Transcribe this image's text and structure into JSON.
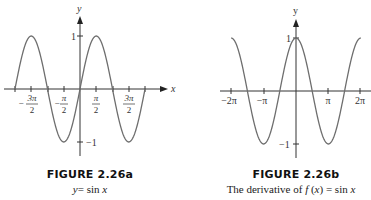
{
  "chart_data": [
    {
      "id": "figure-2-26a",
      "type": "line",
      "title": "FIGURE 2.26a",
      "subtitle": "y = sin x",
      "xlabel": "x",
      "ylabel": "y",
      "function": "sin(x)",
      "x_range": [
        -6.2832,
        6.2832
      ],
      "ylim": [
        -1,
        1
      ],
      "x_ticks": [
        -4.7124,
        -1.5708,
        1.5708,
        4.7124
      ],
      "x_tick_labels": [
        "-3π/2",
        "-π/2",
        "π/2",
        "3π/2"
      ],
      "x_ticks_unlabeled": [
        -6.2832,
        -3.1416,
        3.1416,
        6.2832
      ],
      "y_ticks": [
        1,
        -1
      ],
      "y_tick_labels": [
        "1",
        "-1"
      ],
      "grid": false,
      "legend": null,
      "x": [
        -6.2832,
        -4.7124,
        -3.1416,
        -1.5708,
        0,
        1.5708,
        3.1416,
        4.7124,
        6.2832
      ],
      "y": [
        0,
        1,
        0,
        -1,
        0,
        1,
        0,
        -1,
        0
      ]
    },
    {
      "id": "figure-2-26b",
      "type": "line",
      "title": "FIGURE 2.26b",
      "subtitle": "The derivative of f(x) = sin x",
      "xlabel": "x",
      "ylabel": "y",
      "function": "cos(x)",
      "x_range": [
        -6.2832,
        6.2832
      ],
      "ylim": [
        -1,
        1
      ],
      "x_ticks": [
        -6.2832,
        -3.1416,
        3.1416,
        6.2832
      ],
      "x_tick_labels": [
        "-2π",
        "-π",
        "π",
        "2π"
      ],
      "y_ticks": [
        1,
        -1
      ],
      "y_tick_labels": [
        "1",
        "-1"
      ],
      "grid": false,
      "legend": null,
      "x": [
        -6.2832,
        -4.7124,
        -3.1416,
        -1.5708,
        0,
        1.5708,
        3.1416,
        4.7124,
        6.2832
      ],
      "y": [
        1,
        0,
        -1,
        0,
        1,
        0,
        -1,
        0,
        1
      ]
    }
  ],
  "figures": {
    "a": {
      "title": "FIGURE 2.26a",
      "subtitle_lhs": "y",
      "subtitle_rhs": "= sin ",
      "subtitle_var": "x",
      "axis_x": "x",
      "axis_y": "y",
      "y_top": "1",
      "y_bottom": "−1",
      "ticks": {
        "neg3pi2_num": "3π",
        "neg3pi2_sign": "−",
        "negpi2_num": "π",
        "negpi2_sign": "−",
        "pi2_num": "π",
        "threepi2_num": "3π",
        "den": "2"
      }
    },
    "b": {
      "title": "FIGURE 2.26b",
      "subtitle_text": "The derivative of ",
      "subtitle_f": "f",
      "subtitle_mid": " (",
      "subtitle_x": "x",
      "subtitle_end": ") = sin ",
      "subtitle_x2": "x",
      "axis_y": "y",
      "y_top": "1",
      "y_bottom": "−1",
      "ticks": {
        "neg2pi": "−2π",
        "negpi": "−π",
        "pi": "π",
        "twopi": "2π"
      }
    }
  },
  "colors": {
    "curve": "#6e6e6e",
    "axis": "#333333",
    "text": "#222222"
  }
}
